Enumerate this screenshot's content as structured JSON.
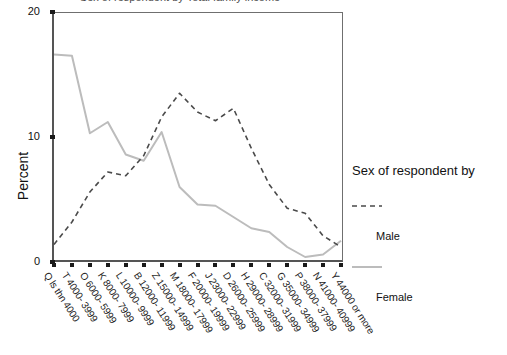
{
  "chart_data": {
    "type": "line",
    "title": "Sex of respondent by Total family income",
    "xlabel": "",
    "ylabel": "Percent",
    "ylim": [
      0,
      20
    ],
    "yticks": [
      0,
      10,
      20
    ],
    "grid": false,
    "legend_position": "right",
    "legend_title": "Sex of respondent by",
    "categories": [
      "Q ls thn 4000",
      "T 4000- 3999",
      "O 6000- 5999",
      "K 8000- 7999",
      "L 10000- 9999",
      "B 12000- 11999",
      "Z 15000- 14999",
      "M 18000- 17999",
      "F 20000- 19999",
      "J 23000- 22999",
      "D 26000- 25999",
      "H 29000- 28999",
      "C 32000- 31999",
      "G 35000- 34999",
      "P 38000- 37999",
      "N 41000- 40999",
      "Y 44000 or more"
    ],
    "series": [
      {
        "name": "Male",
        "style": "dashed",
        "color": "#4a4a4a",
        "values": [
          1.4,
          3.2,
          5.6,
          7.2,
          6.9,
          8.5,
          11.6,
          13.5,
          12.0,
          11.3,
          12.3,
          9.1,
          6.2,
          4.3,
          3.9,
          2.1,
          1.2
        ]
      },
      {
        "name": "Female",
        "style": "solid",
        "color": "#b9b9b9",
        "values": [
          16.6,
          16.5,
          10.3,
          11.2,
          8.6,
          8.1,
          10.4,
          6.0,
          4.6,
          4.5,
          3.6,
          2.7,
          2.4,
          1.2,
          0.4,
          0.6,
          1.7
        ]
      }
    ]
  },
  "axes": {
    "y_title": "Percent",
    "y_tick_labels": [
      "0",
      "10",
      "20"
    ]
  },
  "legend": {
    "title": "Sex of respondent by",
    "entries": [
      {
        "label": "Male",
        "style": "dashed"
      },
      {
        "label": "Female",
        "style": "solid"
      }
    ]
  }
}
